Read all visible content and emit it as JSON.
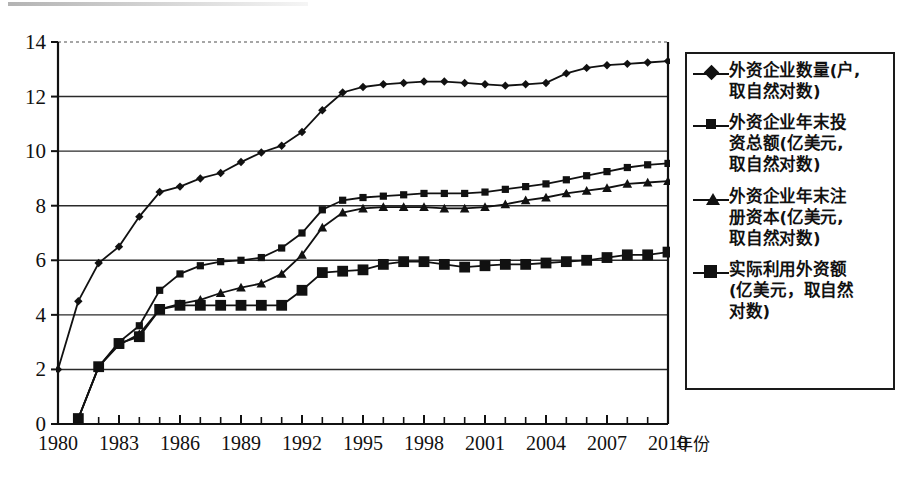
{
  "chart_data": {
    "type": "line",
    "title": "",
    "xlabel": "年份",
    "ylabel": "",
    "xlim": [
      1980,
      2010
    ],
    "ylim": [
      0,
      14
    ],
    "ytick_step": 2,
    "yticks": [
      0,
      2,
      4,
      6,
      8,
      10,
      12,
      14
    ],
    "xticks": [
      1980,
      1983,
      1986,
      1989,
      1992,
      1995,
      1998,
      2001,
      2004,
      2007,
      2010
    ],
    "xtick_interval": 3,
    "x_minor_interval": 1,
    "grid": "horizontal",
    "legend_position": "right-outside",
    "x": [
      1980,
      1981,
      1982,
      1983,
      1984,
      1985,
      1986,
      1987,
      1988,
      1989,
      1990,
      1991,
      1992,
      1993,
      1994,
      1995,
      1996,
      1997,
      1998,
      1999,
      2000,
      2001,
      2002,
      2003,
      2004,
      2005,
      2006,
      2007,
      2008,
      2009,
      2010
    ],
    "series": [
      {
        "name": "外资企业数量(户,取自然对数)",
        "marker": "diamond",
        "values": [
          2.0,
          4.5,
          5.9,
          6.5,
          7.6,
          8.5,
          8.7,
          9.0,
          9.2,
          9.6,
          9.95,
          10.2,
          10.7,
          11.5,
          12.15,
          12.35,
          12.45,
          12.5,
          12.55,
          12.55,
          12.5,
          12.45,
          12.4,
          12.45,
          12.5,
          12.85,
          13.05,
          13.15,
          13.2,
          13.25,
          13.3
        ]
      },
      {
        "name": "外资企业年末投资总额(亿美元,取自然对数)",
        "marker": "square",
        "values": [
          null,
          0.2,
          2.1,
          3.0,
          3.6,
          4.9,
          5.5,
          5.8,
          5.95,
          6.0,
          6.1,
          6.45,
          7.0,
          7.85,
          8.2,
          8.3,
          8.35,
          8.4,
          8.45,
          8.45,
          8.45,
          8.5,
          8.6,
          8.7,
          8.8,
          8.95,
          9.1,
          9.25,
          9.4,
          9.5,
          9.55
        ]
      },
      {
        "name": "外资企业年末注册资本(亿美元,取自然对数)",
        "marker": "triangle",
        "values": [
          null,
          0.2,
          2.1,
          2.9,
          3.3,
          4.2,
          4.4,
          4.55,
          4.8,
          5.0,
          5.15,
          5.5,
          6.2,
          7.2,
          7.75,
          7.9,
          7.95,
          7.95,
          7.95,
          7.9,
          7.9,
          7.95,
          8.05,
          8.2,
          8.3,
          8.45,
          8.55,
          8.65,
          8.8,
          8.85,
          8.9
        ]
      },
      {
        "name": "实际利用外资额(亿美元,取自然对数)",
        "marker": "big-square",
        "values": [
          null,
          0.2,
          2.1,
          2.95,
          3.2,
          4.2,
          4.35,
          4.35,
          4.35,
          4.35,
          4.35,
          4.35,
          4.9,
          5.55,
          5.6,
          5.65,
          5.85,
          5.95,
          5.95,
          5.85,
          5.75,
          5.8,
          5.85,
          5.85,
          5.9,
          5.95,
          6.0,
          6.1,
          6.2,
          6.2,
          6.3
        ]
      }
    ]
  },
  "axes": {
    "y_tick_labels": [
      "14",
      "12",
      "10",
      "8",
      "6",
      "4",
      "2",
      "0"
    ],
    "x_tick_labels": [
      "1980",
      "1983",
      "1986",
      "1989",
      "1992",
      "1995",
      "1998",
      "2001",
      "2004",
      "2007",
      "2010"
    ],
    "x_axis_name": "年份"
  },
  "legend": {
    "entries": [
      {
        "marker": "diamond-marker-icon",
        "label": "外资企业数量(户,\n取自然对数)"
      },
      {
        "marker": "square-marker-icon",
        "label": "外资企业年末投\n资总额(亿美元,\n取自然对数)"
      },
      {
        "marker": "triangle-marker-icon",
        "label": "外资企业年末注\n册资本(亿美元,\n取自然对数)"
      },
      {
        "marker": "big-square-marker-icon",
        "label": "实际利用外资额\n(亿美元，取自然\n对数)"
      }
    ]
  },
  "colors": {
    "line": "#111111",
    "grid": "#2a2a2a",
    "background": "#ffffff"
  }
}
